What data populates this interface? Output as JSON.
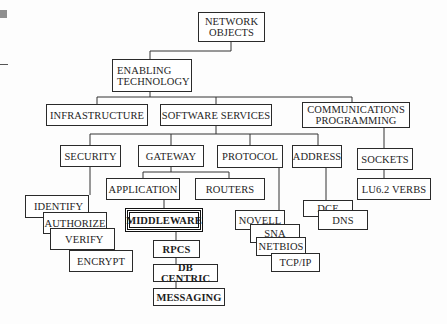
{
  "diagram": {
    "root": {
      "label_1": "NETWORK",
      "label_2": "OBJECTS"
    },
    "enabling": {
      "label_1": "ENABLING",
      "label_2": "TECHNOLOGY"
    },
    "infrastructure": "INFRASTRUCTURE",
    "software_services": "SOFTWARE SERVICES",
    "comms": {
      "label_1": "COMMUNICATIONS",
      "label_2": "PROGRAMMING"
    },
    "security": "SECURITY",
    "gateway": "GATEWAY",
    "protocol": "PROTOCOL",
    "address": "ADDRESS",
    "sockets": "SOCKETS",
    "lu62": "LU6.2 VERBS",
    "identify": "IDENTIFY",
    "authorize": "AUTHORIZE",
    "verify": "VERIFY",
    "encrypt": "ENCRYPT",
    "application": "APPLICATION",
    "routers": "ROUTERS",
    "middleware": "MIDDLEWARE",
    "rpcs": "RPCS",
    "db_centric": "DB CENTRIC",
    "messaging": "MESSAGING",
    "novell": "NOVELL",
    "sna": "SNA",
    "netbios": "NETBIOS",
    "tcpip": "TCP/IP",
    "dce": "DCE",
    "dns": "DNS"
  }
}
